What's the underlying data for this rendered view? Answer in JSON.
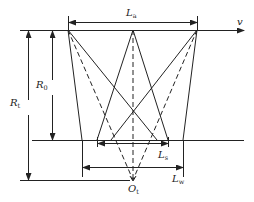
{
  "diagram": {
    "type": "geometry-schematic",
    "stroke_color": "#222222",
    "background": "#ffffff",
    "labels": {
      "La": {
        "main": "L",
        "sub": "a"
      },
      "v": {
        "main": "v",
        "sub": ""
      },
      "R0": {
        "main": "R",
        "sub": "0"
      },
      "Rt": {
        "main": "R",
        "sub": "t"
      },
      "Ls": {
        "main": "L",
        "sub": "s"
      },
      "Lw": {
        "main": "L",
        "sub": "w"
      },
      "Ot": {
        "main": "O",
        "sub": "t"
      }
    },
    "points": {
      "top_left": [
        68,
        30
      ],
      "top_center": [
        133,
        30
      ],
      "top_right": [
        197,
        30
      ],
      "focus_Ot": [
        133,
        180
      ]
    },
    "dimensions": [
      {
        "name": "La",
        "from": [
          68,
          22
        ],
        "to": [
          197,
          22
        ]
      },
      {
        "name": "R0",
        "from": [
          52,
          31
        ],
        "to": [
          52,
          140
        ]
      },
      {
        "name": "Rt",
        "from": [
          28,
          31
        ],
        "to": [
          28,
          180
        ]
      },
      {
        "name": "Ls",
        "from": [
          97,
          143
        ],
        "to": [
          168,
          143
        ]
      },
      {
        "name": "Lw",
        "from": [
          84,
          167
        ],
        "to": [
          183,
          167
        ]
      }
    ]
  }
}
